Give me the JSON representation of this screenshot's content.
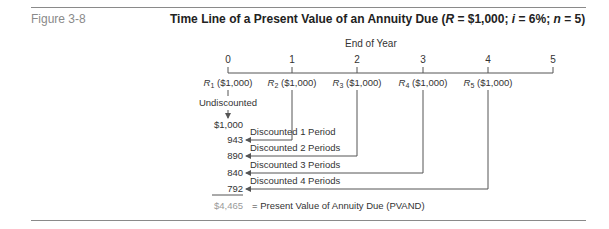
{
  "figure_label": "Figure 3-8",
  "title": {
    "prefix": "Time Line of a Present Value of an Annuity Due (",
    "r_symbol": "R",
    "r_value": " = $1,000; ",
    "i_symbol": "i",
    "i_value": " = 6%; ",
    "n_symbol": "n",
    "n_value": " = 5)"
  },
  "axis_caption": "End of Year",
  "periods": [
    "0",
    "1",
    "2",
    "3",
    "4",
    "5"
  ],
  "receipts": [
    {
      "symbol": "R",
      "sub": "1",
      "amount": "($1,000)"
    },
    {
      "symbol": "R",
      "sub": "2",
      "amount": "($1,000)"
    },
    {
      "symbol": "R",
      "sub": "3",
      "amount": "($1,000)"
    },
    {
      "symbol": "R",
      "sub": "4",
      "amount": "($1,000)"
    },
    {
      "symbol": "R",
      "sub": "5",
      "amount": "($1,000)"
    }
  ],
  "undiscounted_label": "Undiscounted",
  "present_values": [
    "$1,000",
    "943",
    "890",
    "840",
    "792"
  ],
  "discount_labels": [
    "Discounted 1 Period",
    "Discounted 2 Periods",
    "Discounted 3 Periods",
    "Discounted 4 Periods"
  ],
  "total": {
    "value": "$4,465",
    "label": "= Present Value of Annuity Due (PVAND)"
  },
  "colors": {
    "text": "#2a2a2a",
    "muted": "#8a8a8a",
    "line": "#555555"
  }
}
